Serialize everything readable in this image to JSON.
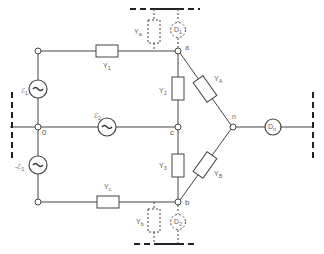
{
  "diagram": {
    "type": "three-phase electrical network schematic",
    "nodes": {
      "o": "0",
      "a": "a",
      "b": "b",
      "c": "c",
      "n": "n"
    },
    "sources": {
      "e1_top": {
        "label": "ℰ",
        "sub": "1"
      },
      "e2_mid": {
        "label": "ℰ",
        "sub": "2"
      },
      "e1_bot": {
        "label": "-ℰ",
        "sub": "1"
      }
    },
    "admittances": {
      "y1": {
        "label": "Y",
        "sub": "1"
      },
      "yc": {
        "label": "Y",
        "sub": "c"
      },
      "y2": {
        "label": "Y",
        "sub": "2"
      },
      "y3": {
        "label": "Y",
        "sub": "3"
      },
      "yA": {
        "label": "Y",
        "sub": "A"
      },
      "yB": {
        "label": "Y",
        "sub": "B"
      },
      "ya": {
        "label": "Y",
        "sub": "a"
      },
      "yb": {
        "label": "Y",
        "sub": "b"
      }
    },
    "meters": {
      "d1": {
        "label": "D",
        "sub": "1"
      },
      "d2": {
        "label": "D",
        "sub": "2"
      },
      "dn": {
        "label": "D",
        "sub": "n"
      }
    }
  }
}
